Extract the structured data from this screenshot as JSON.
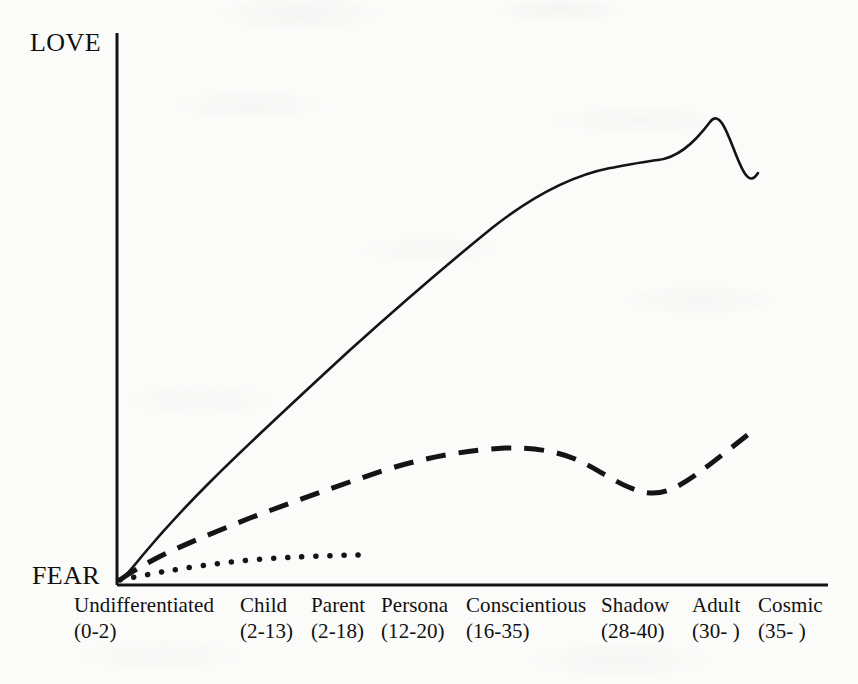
{
  "figure": {
    "background_color": "#fbfbfa",
    "ink_color": "#111111"
  },
  "axes": {
    "y_top_label": "LOVE",
    "y_bottom_label": "FEAR",
    "x_axis_line": true,
    "y_axis_line": true
  },
  "chart_data": {
    "type": "line",
    "title": "",
    "subtitle": "",
    "xlabel": "",
    "ylabel": "",
    "grid": false,
    "legend": "none",
    "y_axis_type": "qualitative",
    "y_axis_low_label": "FEAR",
    "y_axis_high_label": "LOVE",
    "ylim": [
      0,
      100
    ],
    "xlim": [
      0,
      100
    ],
    "categories": [
      "Undifferentiated",
      "Child",
      "Parent",
      "Persona",
      "Conscientious",
      "Shadow",
      "Adult",
      "Cosmic"
    ],
    "category_ranges": [
      "(0-2)",
      "(2-13)",
      "(2-18)",
      "(12-20)",
      "(16-35)",
      "(28-40)",
      "(30- )",
      "(35- )"
    ],
    "category_x": [
      0,
      19,
      30,
      37,
      48,
      68,
      81,
      90
    ],
    "series": [
      {
        "name": "solid",
        "style": "solid",
        "x": [
          0.4,
          3,
          8,
          16,
          26,
          38,
          50,
          62,
          71,
          76,
          80,
          86,
          90
        ],
        "values": [
          1,
          8,
          16,
          26,
          37,
          49,
          61,
          72,
          79,
          81,
          82,
          91,
          100
        ]
      },
      {
        "name": "dashed",
        "style": "dashed",
        "x": [
          0.4,
          4,
          10,
          20,
          32,
          44,
          56,
          65,
          71,
          76,
          82,
          90
        ],
        "values": [
          1,
          6,
          11,
          18,
          25,
          31,
          38,
          43,
          45,
          42,
          46,
          55
        ]
      },
      {
        "name": "dotted",
        "style": "dotted",
        "x": [
          0.4,
          4,
          10,
          17,
          24,
          30,
          35
        ],
        "values": [
          1,
          4,
          7,
          10,
          12,
          13,
          14
        ]
      }
    ]
  }
}
